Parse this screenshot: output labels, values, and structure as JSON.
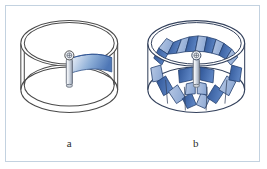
{
  "figure": {
    "type": "technical-line-diagram",
    "border_color": "#c3d2e0",
    "background_color": "#ffffff",
    "panels": [
      {
        "id": "a",
        "label": "a",
        "caption_text": "a",
        "subject": "cylindrical drum rotor with single curved blade",
        "blade_count": 1,
        "has_center_shaft": true,
        "shaft_head": "bolt-head-circle",
        "drum_style": "double-wall-open-cylinder",
        "blade_fill_light": "#eaf0f8",
        "blade_fill_mid": "#93b2d8",
        "blade_fill_dark": "#4a74b4",
        "outline_color": "#4a4a4a",
        "shaft_color": "#d7dde6"
      },
      {
        "id": "b",
        "label": "b",
        "caption_text": "b",
        "subject": "cylindrical drum rotor fully populated with radial blades",
        "blade_count": 14,
        "has_center_shaft": true,
        "shaft_head": "bolt-head-circle",
        "drum_style": "double-wall-open-cylinder",
        "blade_fill_light": "#a9bede",
        "blade_fill_mid": "#5b82c0",
        "blade_fill_dark": "#2f5596",
        "outline_color": "#33415c",
        "shaft_color": "#d7dde6"
      }
    ]
  },
  "colors": {
    "accent_blue": "#3b64a8",
    "pale_blue": "#c3d2e0",
    "ink": "#2b2b2b"
  }
}
